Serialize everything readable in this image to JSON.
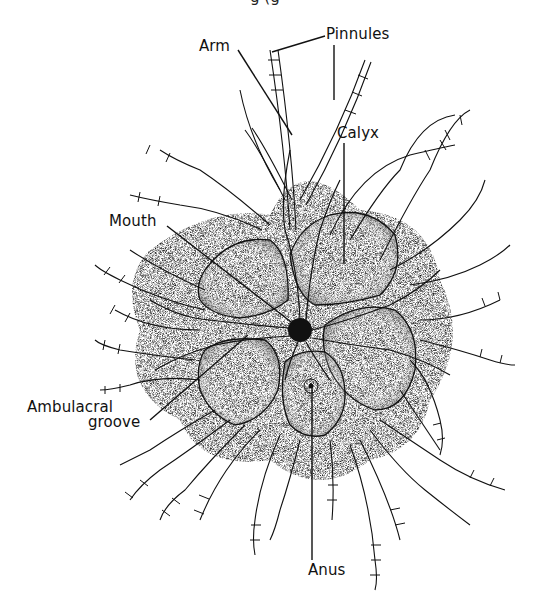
{
  "figure": {
    "cutoff_caption_fragment": "g                    (g",
    "labels": {
      "arm": "Arm",
      "pinnules": "Pinnules",
      "calyx": "Calyx",
      "mouth": "Mouth",
      "ambulacral_line1": "Ambulacral",
      "ambulacral_line2": "groove",
      "anus": "Anus"
    },
    "colors": {
      "ink": "#111111",
      "background": "#ffffff",
      "stipple": "#555555"
    }
  }
}
